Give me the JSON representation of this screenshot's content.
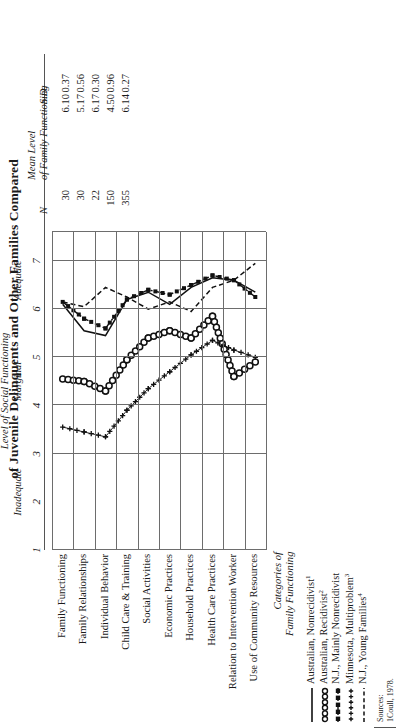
{
  "title": "of Juvenile Delinquents and Other Families Compared",
  "axis": {
    "label": "Level of Social Functioning",
    "ticks": [
      "1",
      "2",
      "3",
      "4",
      "5",
      "6",
      "7"
    ],
    "zones": [
      "Inadequate",
      "Marginal",
      "Adequate"
    ],
    "range": [
      1,
      7.6
    ]
  },
  "category_header": [
    "Categories of",
    "Family Functioning"
  ],
  "columns": {
    "n_header": "N",
    "mean_header": [
      "Mean Level",
      "of Family Functioning"
    ],
    "sd_header": "S.D."
  },
  "legend_items": [
    {
      "label": "Australian, Nonrecidivist",
      "note": "1",
      "marker": "solid-line"
    },
    {
      "label": "Australian, Recidivist",
      "note": "2",
      "marker": "open-circles"
    },
    {
      "label": "N.J., Mainly Nonrecidivist",
      "note": "",
      "marker": "dash-dot-squares"
    },
    {
      "label": "Minnesota, Multiproblem",
      "note": "3",
      "marker": "plus-signs"
    },
    {
      "label": "N.J., Young Families",
      "note": "4",
      "marker": "dashed-line"
    }
  ],
  "sources": [
    "Sources:",
    "1Coull, 1978."
  ],
  "chart_data": {
    "type": "line",
    "title": "of Juvenile Delinquents and Other Families Compared",
    "xlabel": "Level of Social Functioning",
    "ylabel": "Categories of Family Functioning",
    "xlim": [
      1,
      7.6
    ],
    "grid": true,
    "legend_position": "bottom",
    "categories": [
      "Family Functioning",
      "Family Relationships",
      "Individual Behavior",
      "Child Care & Training",
      "Social Activities",
      "Economic Practices",
      "Household Practices",
      "Health Care Practices",
      "Relation to Intervention Worker",
      "Use of Community Resources"
    ],
    "zone_boundaries": [
      {
        "label": "Inadequate",
        "from": 1,
        "to": 3.4
      },
      {
        "label": "Marginal",
        "from": 3.4,
        "to": 5.6
      },
      {
        "label": "Adequate",
        "from": 5.6,
        "to": 7.6
      }
    ],
    "series": [
      {
        "name": "Australian, Nonrecidivist",
        "marker": "solid-line",
        "n": 30,
        "mean_level": 6.1,
        "sd": 0.37,
        "values": [
          6.1,
          5.55,
          5.45,
          6.2,
          6.35,
          6.1,
          6.45,
          6.65,
          6.6,
          6.35
        ]
      },
      {
        "name": "Australian, Recidivist",
        "marker": "open-circles",
        "n": 30,
        "mean_level": 5.17,
        "sd": 0.56,
        "values": [
          4.55,
          4.5,
          4.3,
          4.95,
          5.4,
          5.55,
          5.4,
          5.85,
          4.6,
          4.9
        ]
      },
      {
        "name": "N.J., Mainly Nonrecidivist",
        "marker": "dash-dot-squares",
        "n": 22,
        "mean_level": 6.17,
        "sd": 0.3,
        "values": [
          6.15,
          5.8,
          5.6,
          6.2,
          6.4,
          6.3,
          6.5,
          6.7,
          6.6,
          6.25
        ]
      },
      {
        "name": "Minnesota, Multiproblem",
        "marker": "plus-signs",
        "n": 150,
        "mean_level": 4.5,
        "sd": 0.96,
        "values": [
          3.55,
          3.45,
          3.35,
          3.9,
          4.35,
          4.7,
          5.05,
          5.35,
          5.15,
          5.0
        ]
      },
      {
        "name": "N.J., Young Families",
        "marker": "dashed-line",
        "n": 355,
        "mean_level": 6.14,
        "sd": 0.27,
        "values": [
          6.15,
          6.05,
          6.45,
          6.25,
          6.0,
          6.15,
          5.95,
          6.45,
          6.6,
          6.95
        ]
      }
    ]
  }
}
